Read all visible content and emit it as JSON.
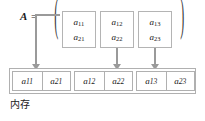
{
  "figure": {
    "matrix_label": "A",
    "equals": "=",
    "paren_left": "(",
    "paren_right": ")",
    "caption": "内存",
    "colors": {
      "arrow": "#9a9a9a",
      "box_border": "#b4b4b4",
      "cell_border": "#b0b0b0",
      "text": "#1a1a1a",
      "background": "#ffffff"
    },
    "matrix_columns": [
      {
        "top": "a",
        "top_sub": "11",
        "bottom": "a",
        "bottom_sub": "21"
      },
      {
        "top": "a",
        "top_sub": "12",
        "bottom": "a",
        "bottom_sub": "22"
      },
      {
        "top": "a",
        "top_sub": "13",
        "bottom": "a",
        "bottom_sub": "23"
      }
    ],
    "memory_groups": [
      {
        "cells": [
          {
            "base": "a",
            "sub": "11"
          },
          {
            "base": "a",
            "sub": "21"
          }
        ]
      },
      {
        "cells": [
          {
            "base": "a",
            "sub": "12"
          },
          {
            "base": "a",
            "sub": "22"
          }
        ]
      },
      {
        "cells": [
          {
            "base": "a",
            "sub": "13"
          },
          {
            "base": "a",
            "sub": "23"
          }
        ]
      }
    ],
    "arrows": [
      {
        "name": "arrow-column-1"
      },
      {
        "name": "arrow-column-2"
      },
      {
        "name": "arrow-column-3"
      }
    ]
  }
}
